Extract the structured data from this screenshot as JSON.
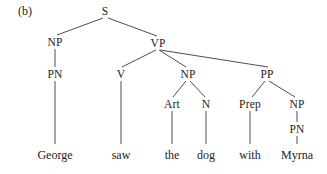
{
  "figure": {
    "label": "(b)",
    "width": 327,
    "height": 174,
    "background_color": "#ffffff",
    "line_color": "#3a3a3a",
    "text_color": "#1c1c1c"
  },
  "tree": {
    "sentence": "George saw the dog with Myrna",
    "nodes": [
      {
        "id": "S",
        "label": "S",
        "x": 105,
        "y": 11
      },
      {
        "id": "NP1",
        "label": "NP",
        "x": 55,
        "y": 42
      },
      {
        "id": "VP",
        "label": "VP",
        "x": 158,
        "y": 43
      },
      {
        "id": "PN1",
        "label": "PN",
        "x": 55,
        "y": 74
      },
      {
        "id": "V",
        "label": "V",
        "x": 121,
        "y": 74
      },
      {
        "id": "NP2",
        "label": "NP",
        "x": 188,
        "y": 74
      },
      {
        "id": "PP",
        "label": "PP",
        "x": 267,
        "y": 74
      },
      {
        "id": "Art",
        "label": "Art",
        "x": 172,
        "y": 104
      },
      {
        "id": "N",
        "label": "N",
        "x": 206,
        "y": 104
      },
      {
        "id": "Prep",
        "label": "Prep",
        "x": 250,
        "y": 104
      },
      {
        "id": "NP3",
        "label": "NP",
        "x": 297,
        "y": 104
      },
      {
        "id": "PN2",
        "label": "PN",
        "x": 297,
        "y": 129
      }
    ],
    "leaves": [
      {
        "id": "w-george",
        "label": "George",
        "x": 55,
        "y": 148
      },
      {
        "id": "w-saw",
        "label": "saw",
        "x": 121,
        "y": 148
      },
      {
        "id": "w-the",
        "label": "the",
        "x": 172,
        "y": 148
      },
      {
        "id": "w-dog",
        "label": "dog",
        "x": 206,
        "y": 148
      },
      {
        "id": "w-with",
        "label": "with",
        "x": 250,
        "y": 148
      },
      {
        "id": "w-myrna",
        "label": "Myrna",
        "x": 297,
        "y": 148
      }
    ],
    "edges": [
      {
        "from": "S",
        "to": "NP1",
        "x1": 103,
        "y1": 18,
        "x2": 57,
        "y2": 35
      },
      {
        "from": "S",
        "to": "VP",
        "x1": 108,
        "y1": 18,
        "x2": 157,
        "y2": 36
      },
      {
        "from": "NP1",
        "to": "PN1",
        "x1": 55,
        "y1": 49,
        "x2": 55,
        "y2": 67
      },
      {
        "from": "PN1",
        "to": "w-george",
        "x1": 55,
        "y1": 81,
        "x2": 55,
        "y2": 144
      },
      {
        "from": "VP",
        "to": "V",
        "x1": 156,
        "y1": 50,
        "x2": 122,
        "y2": 67
      },
      {
        "from": "VP",
        "to": "NP2",
        "x1": 159,
        "y1": 50,
        "x2": 186,
        "y2": 67
      },
      {
        "from": "VP",
        "to": "PP",
        "x1": 160,
        "y1": 50,
        "x2": 268,
        "y2": 67
      },
      {
        "from": "V",
        "to": "w-saw",
        "x1": 121,
        "y1": 81,
        "x2": 121,
        "y2": 144
      },
      {
        "from": "NP2",
        "to": "Art",
        "x1": 186,
        "y1": 81,
        "x2": 173,
        "y2": 97
      },
      {
        "from": "NP2",
        "to": "N",
        "x1": 190,
        "y1": 81,
        "x2": 205,
        "y2": 97
      },
      {
        "from": "Art",
        "to": "w-the",
        "x1": 172,
        "y1": 111,
        "x2": 172,
        "y2": 144
      },
      {
        "from": "N",
        "to": "w-dog",
        "x1": 206,
        "y1": 111,
        "x2": 206,
        "y2": 144
      },
      {
        "from": "PP",
        "to": "Prep",
        "x1": 265,
        "y1": 81,
        "x2": 252,
        "y2": 97
      },
      {
        "from": "PP",
        "to": "NP3",
        "x1": 269,
        "y1": 81,
        "x2": 295,
        "y2": 97
      },
      {
        "from": "Prep",
        "to": "w-with",
        "x1": 250,
        "y1": 111,
        "x2": 250,
        "y2": 144
      },
      {
        "from": "NP3",
        "to": "PN2",
        "x1": 297,
        "y1": 111,
        "x2": 297,
        "y2": 122
      },
      {
        "from": "PN2",
        "to": "w-myrna",
        "x1": 297,
        "y1": 136,
        "x2": 297,
        "y2": 144
      }
    ]
  }
}
